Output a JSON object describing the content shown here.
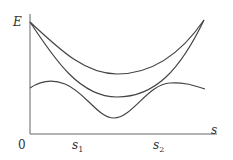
{
  "diagram": {
    "y_axis_label": "E",
    "x_axis_label": "s",
    "origin_label": "0",
    "ticks": [
      {
        "base": "s",
        "sub": "1"
      },
      {
        "base": "s",
        "sub": "2"
      }
    ],
    "colors": {
      "curve": "#444444",
      "axis": "#666666",
      "background": "#ffffff"
    },
    "curves": [
      {
        "name": "upper-curve",
        "description": "U-shaped, starts at E-axis top, minimum between s1 and s2, rises to top right"
      },
      {
        "name": "middle-curve",
        "description": "Deeper U-shape sharing endpoints with upper curve"
      },
      {
        "name": "lower-curve",
        "description": "Double-hump curve with minimum between s1 and s2"
      }
    ]
  }
}
